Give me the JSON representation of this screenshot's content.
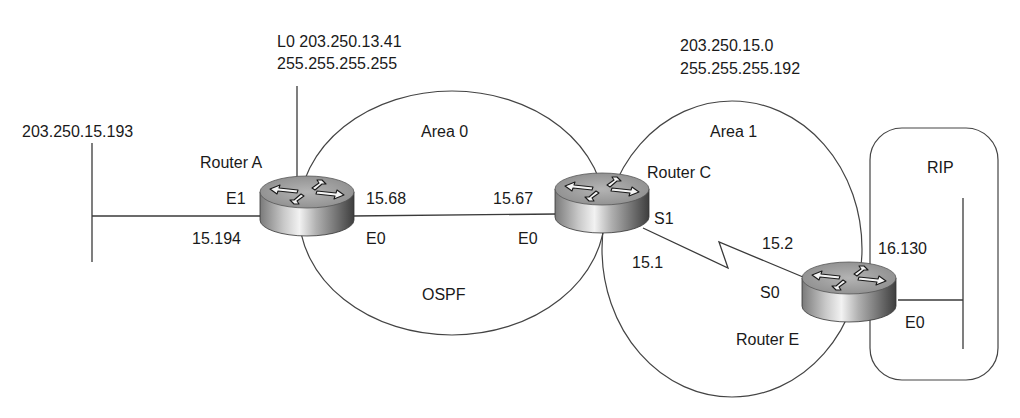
{
  "diagram": {
    "type": "network-topology",
    "colors": {
      "line": "#3a3a3a",
      "text": "#1a1a1a",
      "router_top": "#9a9a9a",
      "router_body_light": "#e8e8e8",
      "router_body_dark": "#4a4a4a"
    },
    "networks": {
      "left_ethernet": {
        "label": "203.250.15.193"
      },
      "loopback": {
        "line1": "L0 203.250.13.41",
        "line2": "255.255.255.255"
      },
      "area1_subnet": {
        "line1": "203.250.15.0",
        "line2": "255.255.255.192"
      }
    },
    "areas": {
      "area0": {
        "label": "Area 0",
        "protocol_label": "OSPF"
      },
      "area1": {
        "label": "Area 1"
      },
      "rip": {
        "label": "RIP"
      }
    },
    "routers": {
      "a": {
        "name": "Router A",
        "icon": "router-icon",
        "interfaces": {
          "e1": "E1",
          "e1_addr": "15.194",
          "e0": "E0",
          "e0_addr": "15.68"
        }
      },
      "c": {
        "name": "Router C",
        "icon": "router-icon",
        "interfaces": {
          "e0": "E0",
          "e0_addr": "15.67",
          "s1": "S1",
          "s1_addr": "15.1"
        }
      },
      "e": {
        "name": "Router E",
        "icon": "router-icon",
        "interfaces": {
          "s0": "S0",
          "s0_addr": "15.2",
          "e0": "E0",
          "e0_addr": "16.130"
        }
      }
    }
  }
}
